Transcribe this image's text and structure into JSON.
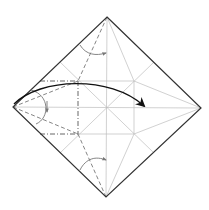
{
  "diagram": {
    "type": "crease-pattern",
    "paper": "square, diamond orientation",
    "colors": {
      "edge": "#333333",
      "crease": "#bdbdbd",
      "valley": "#777777",
      "mountain": "#555555",
      "main_arrow": "#111111",
      "small_arrow": "#777777"
    },
    "fold_lines": [
      {
        "kind": "valley",
        "description": "left flap upper diagonal"
      },
      {
        "kind": "valley",
        "description": "left flap lower diagonal"
      },
      {
        "kind": "mountain",
        "description": "upper horizontal"
      },
      {
        "kind": "mountain",
        "description": "lower horizontal"
      },
      {
        "kind": "mountain",
        "description": "vertical"
      },
      {
        "kind": "valley",
        "description": "top corner fold"
      },
      {
        "kind": "valley",
        "description": "bottom corner fold"
      }
    ],
    "arrows": [
      {
        "kind": "fold-over",
        "from": "left corner",
        "to": "right of center",
        "description": "main fold arrow"
      },
      {
        "kind": "valley-fold",
        "location": "left",
        "description": "small curved arrow"
      },
      {
        "kind": "valley-fold",
        "location": "top",
        "description": "small curved arrow"
      },
      {
        "kind": "valley-fold",
        "location": "bottom",
        "description": "small curved arrow"
      }
    ]
  }
}
